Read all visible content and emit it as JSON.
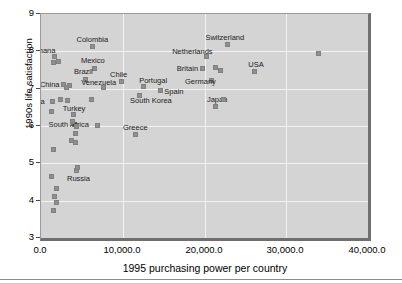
{
  "chart_data": {
    "type": "scatter",
    "title": "",
    "xlabel": "1995 purchasing power per country",
    "ylabel": "1990s life satisfaction",
    "xlim": [
      0,
      40000
    ],
    "ylim": [
      3,
      9
    ],
    "xticks": [
      "0.0",
      "10,000.0",
      "20,000.0",
      "30,000.0",
      "40,000.0"
    ],
    "xtick_values": [
      0,
      10000,
      20000,
      30000,
      40000
    ],
    "yticks": [
      "9",
      "8",
      "7",
      "6",
      "5",
      "4",
      "3"
    ],
    "ytick_values": [
      9,
      8,
      7,
      6,
      5,
      4,
      3
    ],
    "grid": true,
    "legend": "none",
    "marker_color": "#8f8f8f",
    "plot_background": "#d4d4d4",
    "grid_color": "#f4f4f4",
    "points": [
      {
        "label": "Colombia",
        "x": 6300,
        "y": 8.12
      },
      {
        "label": "Ghana",
        "x": 1700,
        "y": 7.85
      },
      {
        "label": "",
        "x": 2100,
        "y": 7.72
      },
      {
        "label": "",
        "x": 1500,
        "y": 7.7
      },
      {
        "label": "Mexico",
        "x": 6600,
        "y": 7.55
      },
      {
        "label": "Brazil",
        "x": 5500,
        "y": 7.25
      },
      {
        "label": "Chile",
        "x": 9800,
        "y": 7.18
      },
      {
        "label": "China",
        "x": 2800,
        "y": 7.1
      },
      {
        "label": "",
        "x": 3500,
        "y": 7.08
      },
      {
        "label": "",
        "x": 3100,
        "y": 7.02
      },
      {
        "label": "Venezuela",
        "x": 7600,
        "y": 7.02
      },
      {
        "label": "Portugal",
        "x": 12500,
        "y": 7.05
      },
      {
        "label": "Spain",
        "x": 14600,
        "y": 6.95
      },
      {
        "label": "South Korea",
        "x": 12000,
        "y": 6.82
      },
      {
        "label": "India",
        "x": 1400,
        "y": 6.65
      },
      {
        "label": "",
        "x": 2400,
        "y": 6.72
      },
      {
        "label": "",
        "x": 3300,
        "y": 6.68
      },
      {
        "label": "",
        "x": 6200,
        "y": 6.7
      },
      {
        "label": "",
        "x": 1300,
        "y": 6.38
      },
      {
        "label": "Turkey",
        "x": 4000,
        "y": 6.3
      },
      {
        "label": "South Africa",
        "x": 4100,
        "y": 6.05
      },
      {
        "label": "",
        "x": 3800,
        "y": 6.12
      },
      {
        "label": "",
        "x": 4300,
        "y": 5.98
      },
      {
        "label": "",
        "x": 4200,
        "y": 5.8
      },
      {
        "label": "",
        "x": 6900,
        "y": 6.02
      },
      {
        "label": "Greece",
        "x": 11500,
        "y": 5.78
      },
      {
        "label": "",
        "x": 3700,
        "y": 5.62
      },
      {
        "label": "",
        "x": 4200,
        "y": 5.55
      },
      {
        "label": "",
        "x": 1500,
        "y": 5.38
      },
      {
        "label": "Russia",
        "x": 4400,
        "y": 4.8
      },
      {
        "label": "",
        "x": 4500,
        "y": 4.88
      },
      {
        "label": "",
        "x": 1300,
        "y": 4.65
      },
      {
        "label": "",
        "x": 1900,
        "y": 4.32
      },
      {
        "label": "",
        "x": 1600,
        "y": 4.1
      },
      {
        "label": "",
        "x": 1900,
        "y": 3.95
      },
      {
        "label": "",
        "x": 1500,
        "y": 3.75
      },
      {
        "label": "Switzerland",
        "x": 22800,
        "y": 8.18
      },
      {
        "label": "Netherlands",
        "x": 20200,
        "y": 7.85
      },
      {
        "label": "Britain",
        "x": 19800,
        "y": 7.55
      },
      {
        "label": "",
        "x": 21300,
        "y": 7.58
      },
      {
        "label": "",
        "x": 21900,
        "y": 7.48
      },
      {
        "label": "USA",
        "x": 26100,
        "y": 7.45
      },
      {
        "label": "Germany",
        "x": 20800,
        "y": 7.22
      },
      {
        "label": "Japan",
        "x": 21400,
        "y": 6.52
      },
      {
        "label": "",
        "x": 22300,
        "y": 6.72
      },
      {
        "label": "",
        "x": 34000,
        "y": 7.95
      }
    ]
  }
}
